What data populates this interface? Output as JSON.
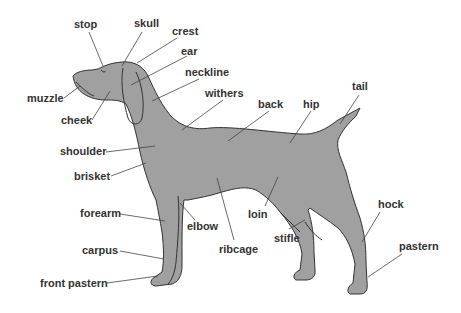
{
  "diagram": {
    "colors": {
      "body": "#a0a0a0",
      "outline": "#333333",
      "leader": "#444444",
      "text": "#333333",
      "background": "#ffffff"
    },
    "labels": [
      {
        "id": "stop",
        "text": "stop",
        "x": 74,
        "y": 18,
        "lx1": 89,
        "ly1": 32,
        "lx2": 103,
        "ly2": 66
      },
      {
        "id": "skull",
        "text": "skull",
        "x": 134,
        "y": 17,
        "lx1": 142,
        "ly1": 32,
        "lx2": 122,
        "ly2": 66
      },
      {
        "id": "crest",
        "text": "crest",
        "x": 172,
        "y": 25,
        "lx1": 177,
        "ly1": 38,
        "lx2": 137,
        "ly2": 63
      },
      {
        "id": "ear",
        "text": "ear",
        "x": 181,
        "y": 45,
        "lx1": 187,
        "ly1": 56,
        "lx2": 131,
        "ly2": 85
      },
      {
        "id": "neckline",
        "text": "neckline",
        "x": 185,
        "y": 66,
        "lx1": 199,
        "ly1": 79,
        "lx2": 152,
        "ly2": 101
      },
      {
        "id": "withers",
        "text": "withers",
        "x": 205,
        "y": 87,
        "lx1": 223,
        "ly1": 100,
        "lx2": 182,
        "ly2": 130
      },
      {
        "id": "back",
        "text": "back",
        "x": 258,
        "y": 98,
        "lx1": 269,
        "ly1": 111,
        "lx2": 228,
        "ly2": 141
      },
      {
        "id": "hip",
        "text": "hip",
        "x": 303,
        "y": 98,
        "lx1": 311,
        "ly1": 111,
        "lx2": 290,
        "ly2": 143
      },
      {
        "id": "tail",
        "text": "tail",
        "x": 352,
        "y": 80,
        "lx1": 359,
        "ly1": 95,
        "lx2": 340,
        "ly2": 124
      },
      {
        "id": "muzzle",
        "text": "muzzle",
        "x": 27,
        "y": 92,
        "lx1": 64,
        "ly1": 98,
        "lx2": 80,
        "ly2": 86
      },
      {
        "id": "cheek",
        "text": "cheek",
        "x": 61,
        "y": 114,
        "lx1": 92,
        "ly1": 120,
        "lx2": 110,
        "ly2": 91
      },
      {
        "id": "shoulder",
        "text": "shoulder",
        "x": 60,
        "y": 145,
        "lx1": 106,
        "ly1": 152,
        "lx2": 155,
        "ly2": 146
      },
      {
        "id": "brisket",
        "text": "brisket",
        "x": 74,
        "y": 170,
        "lx1": 111,
        "ly1": 176,
        "lx2": 146,
        "ly2": 163
      },
      {
        "id": "forearm",
        "text": "forearm",
        "x": 80,
        "y": 207,
        "lx1": 120,
        "ly1": 214,
        "lx2": 165,
        "ly2": 221
      },
      {
        "id": "elbow",
        "text": "elbow",
        "x": 187,
        "y": 220,
        "lx1": 195,
        "ly1": 220,
        "lx2": 180,
        "ly2": 203
      },
      {
        "id": "ribcage",
        "text": "ribcage",
        "x": 219,
        "y": 243,
        "lx1": 234,
        "ly1": 240,
        "lx2": 217,
        "ly2": 178
      },
      {
        "id": "loin",
        "text": "loin",
        "x": 248,
        "y": 208,
        "lx1": 265,
        "ly1": 206,
        "lx2": 278,
        "ly2": 177
      },
      {
        "id": "stifle",
        "text": "stifle",
        "x": 274,
        "y": 232,
        "lx1": 289,
        "ly1": 229,
        "lx2": 305,
        "ly2": 220
      },
      {
        "id": "hock",
        "text": "hock",
        "x": 378,
        "y": 198,
        "lx1": 380,
        "ly1": 212,
        "lx2": 362,
        "ly2": 242
      },
      {
        "id": "pastern",
        "text": "pastern",
        "x": 399,
        "y": 240,
        "lx1": 402,
        "ly1": 254,
        "lx2": 368,
        "ly2": 277
      },
      {
        "id": "carpus",
        "text": "carpus",
        "x": 82,
        "y": 244,
        "lx1": 120,
        "ly1": 251,
        "lx2": 164,
        "ly2": 259
      },
      {
        "id": "front_pastern",
        "text": "front pastern",
        "x": 40,
        "y": 277,
        "lx1": 107,
        "ly1": 283,
        "lx2": 158,
        "ly2": 276
      }
    ]
  }
}
